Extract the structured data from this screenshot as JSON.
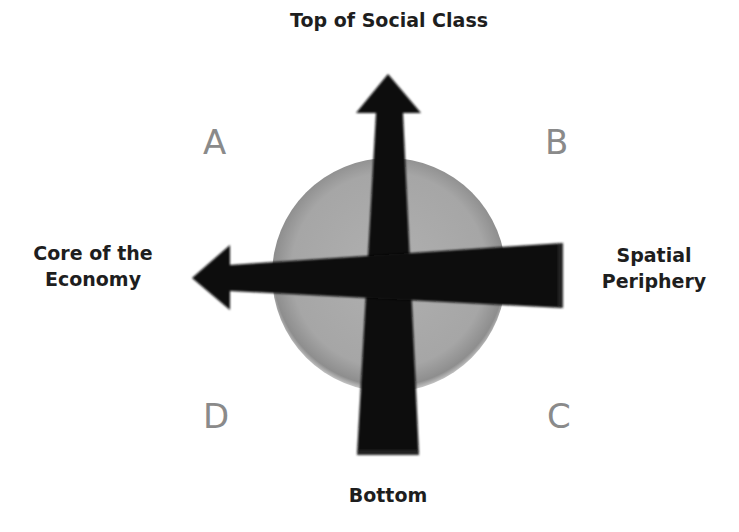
{
  "diagram": {
    "axes": {
      "top_label": "Top of Social Class",
      "bottom_label": "Bottom",
      "left_label_line1": "Core of the",
      "left_label_line2": "Economy",
      "right_label_line1": "Spatial",
      "right_label_line2": "Periphery"
    },
    "quadrants": {
      "top_left": "A",
      "top_right": "B",
      "bottom_right": "C",
      "bottom_left": "D"
    },
    "colors": {
      "arrow": "#0d0d0d",
      "circle": "#a9a9a9",
      "circle_edge": "#8c8c8c",
      "quadrant_letter": "#8a8a8a",
      "label_text": "#1e1e1e",
      "background": "#ffffff"
    }
  }
}
